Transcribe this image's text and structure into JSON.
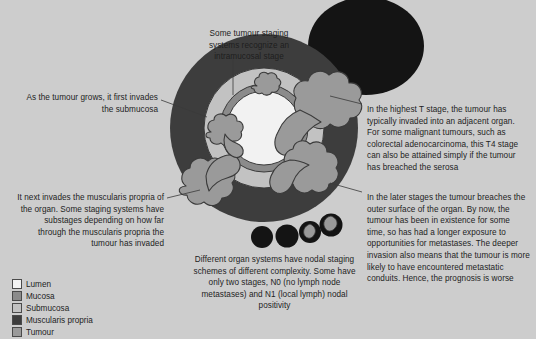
{
  "figure": {
    "background_color": "#cdcdcd"
  },
  "callouts": [
    {
      "id": "intramucosal",
      "name": "callout-intramucosal-stage",
      "align": "center",
      "text": "Some tumour staging systems recognize an intramucosal stage"
    },
    {
      "id": "submucosa",
      "name": "callout-submucosa-invasion",
      "align": "right",
      "text": "As the tumour grows, it first invades the submucosa"
    },
    {
      "id": "muscularis",
      "name": "callout-muscularis-propria",
      "align": "right",
      "text": "It next invades the muscularis propria of the organ. Some staging systems have substages depending on how far through the muscularis propria the tumour has invaded"
    },
    {
      "id": "t4",
      "name": "callout-highest-t-stage",
      "align": "left",
      "text": "In the highest T stage, the tumour has typically invaded into an adjacent organ. For some malignant tumours, such as colorectal adenocarcinoma, this T4 stage can also be attained simply if the tumour has breached the serosa"
    },
    {
      "id": "late",
      "name": "callout-later-stages",
      "align": "left",
      "text": "In the later stages the tumour breaches the outer surface of the organ. By now, the tumour has been in existence for some time, so has had a longer exposure to opportunities for metastases. The deeper invasion also means that the tumour is more likely to have encountered metastatic conduits. Hence, the prognosis is worse"
    },
    {
      "id": "nodal",
      "name": "callout-nodal-staging",
      "align": "center",
      "text": "Different organ systems have nodal staging schemes of different complexity. Some have only two stages, N0 (no lymph node metastases) and N1 (local lymph) nodal positivity"
    }
  ],
  "legend": {
    "name": "legend",
    "items": [
      {
        "label": "Lumen",
        "color": "#f2f2f2"
      },
      {
        "label": "Mucosa",
        "color": "#8b8b8b"
      },
      {
        "label": "Submucosa",
        "color": "#c2c2c2"
      },
      {
        "label": "Muscularis propria",
        "color": "#3d3d3d"
      },
      {
        "label": "Tumour",
        "color": "#9a9a9a"
      }
    ]
  },
  "diagram": {
    "name": "tumour-staging-illustration",
    "organ": {
      "name": "organ-cross-section",
      "layers": {
        "muscularis_propria": "#3d3d3d",
        "submucosa": "#c2c2c2",
        "mucosa": "#8b8b8b",
        "lumen": "#f2f2f2"
      }
    },
    "adjacent_organ": {
      "name": "adjacent-organ",
      "color": "#141414"
    },
    "tumour_color": "#9a9a9a",
    "tumour_outline": "#3a3a3a",
    "lymph_nodes": [
      {
        "name": "lymph-node-negative",
        "involved": false
      },
      {
        "name": "lymph-node-negative",
        "involved": false
      },
      {
        "name": "lymph-node-positive",
        "involved": true
      },
      {
        "name": "lymph-node-positive",
        "involved": true
      }
    ]
  }
}
